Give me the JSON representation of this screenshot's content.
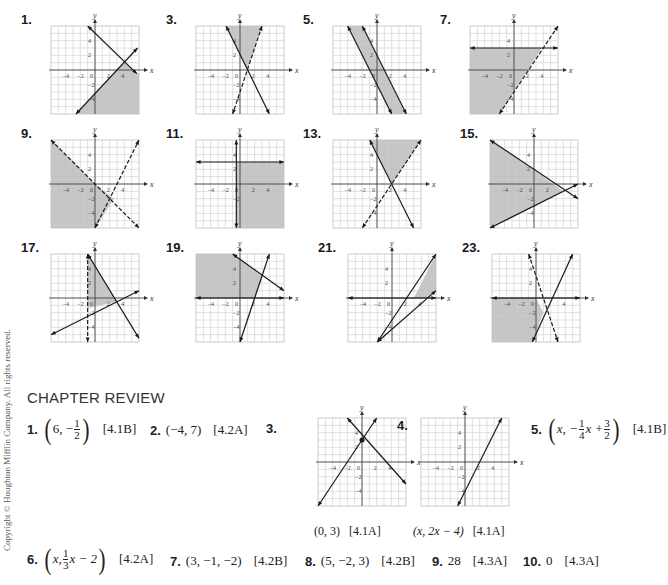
{
  "graphs": [
    {
      "id": "1",
      "label": "1.",
      "x": 33,
      "y": 18,
      "range": [
        -6,
        6
      ],
      "shade": [
        [
          -2.5,
          -6
        ],
        [
          4,
          1
        ],
        [
          6,
          -0.5
        ],
        [
          6,
          -6
        ]
      ],
      "lines": [
        {
          "p1": [
            -1,
            6
          ],
          "p2": [
            5.7,
            -0.5
          ],
          "dashed": false
        },
        {
          "p1": [
            -2.6,
            -6
          ],
          "p2": [
            5.8,
            3
          ],
          "dashed": false
        }
      ],
      "ticks_x": [
        "-4",
        "-2",
        "0",
        "2",
        "4"
      ],
      "ticks_y": [
        "4",
        "2",
        "-2",
        "-4"
      ]
    },
    {
      "id": "3",
      "label": "3.",
      "x": 178,
      "y": 18,
      "range": [
        -6,
        6
      ],
      "shade": [
        [
          -1.9,
          6
        ],
        [
          3,
          6
        ],
        [
          1,
          0
        ]
      ],
      "lines": [
        {
          "p1": [
            -1.9,
            6
          ],
          "p2": [
            4,
            -6
          ],
          "dashed": false
        },
        {
          "p1": [
            3,
            6
          ],
          "p2": [
            -1,
            -6
          ],
          "dashed": true
        }
      ],
      "ticks_x": [
        "-4",
        "-2",
        "0",
        "2",
        "4"
      ],
      "ticks_y": [
        "4",
        "2",
        "-2",
        "-4"
      ]
    },
    {
      "id": "5",
      "label": "5.",
      "x": 315,
      "y": 18,
      "range": [
        -6,
        6
      ],
      "shade": [
        [
          -4,
          6
        ],
        [
          -2,
          6
        ],
        [
          3.9,
          -6
        ],
        [
          1.9,
          -6
        ]
      ],
      "lines": [
        {
          "p1": [
            -4,
            6
          ],
          "p2": [
            2,
            -6
          ],
          "dashed": false
        },
        {
          "p1": [
            -2,
            6
          ],
          "p2": [
            4,
            -6
          ],
          "dashed": false
        }
      ],
      "ticks_x": [
        "-4",
        "-2",
        "0",
        "2",
        "4"
      ],
      "ticks_y": [
        "4",
        "2",
        "-2",
        "-4"
      ]
    },
    {
      "id": "7",
      "label": "7.",
      "x": 452,
      "y": 18,
      "range": [
        -6,
        6
      ],
      "shade": [
        [
          -6,
          3
        ],
        [
          3.8,
          3
        ],
        [
          -2,
          -6
        ],
        [
          -6,
          -6
        ]
      ],
      "lines": [
        {
          "p1": [
            -6,
            3
          ],
          "p2": [
            6,
            3
          ],
          "dashed": false
        },
        {
          "p1": [
            -2,
            -6
          ],
          "p2": [
            6,
            6
          ],
          "dashed": true
        }
      ],
      "ticks_x": [
        "-4",
        "-2",
        "0",
        "2",
        "4"
      ],
      "ticks_y": [
        "4",
        "2",
        "-2",
        "-4"
      ]
    },
    {
      "id": "9",
      "label": "9.",
      "x": 33,
      "y": 132,
      "range": [
        -6,
        6
      ],
      "shade": [
        [
          -6,
          6
        ],
        [
          0,
          0
        ],
        [
          2.6,
          -2
        ],
        [
          0,
          -6
        ],
        [
          -6,
          -6
        ]
      ],
      "lines": [
        {
          "p1": [
            -6,
            6
          ],
          "p2": [
            6,
            -6
          ],
          "dashed": true
        },
        {
          "p1": [
            0,
            -6
          ],
          "p2": [
            6,
            6
          ],
          "dashed": true
        }
      ],
      "ticks_x": [
        "-4",
        "-2",
        "0",
        "2",
        "4"
      ],
      "ticks_y": [
        "4",
        "2",
        "-2",
        "-4"
      ]
    },
    {
      "id": "11",
      "label": "11.",
      "x": 178,
      "y": 132,
      "range": [
        -6,
        6
      ],
      "shade": [
        [
          -0.5,
          3
        ],
        [
          6,
          3
        ],
        [
          6,
          -6
        ],
        [
          -0.5,
          -6
        ]
      ],
      "lines": [
        {
          "p1": [
            -6,
            3
          ],
          "p2": [
            6,
            3
          ],
          "dashed": false
        },
        {
          "p1": [
            -0.5,
            6
          ],
          "p2": [
            -0.5,
            -6
          ],
          "dashed": false
        }
      ],
      "ticks_x": [
        "-4",
        "-2",
        "0",
        "2",
        "4"
      ],
      "ticks_y": [
        "4",
        "2",
        "-2"
      ]
    },
    {
      "id": "13",
      "label": "13.",
      "x": 315,
      "y": 132,
      "range": [
        -6,
        6
      ],
      "shade": [
        [
          -1,
          6
        ],
        [
          6,
          6
        ],
        [
          2,
          0
        ]
      ],
      "lines": [
        {
          "p1": [
            -1,
            6
          ],
          "p2": [
            5,
            -6
          ],
          "dashed": false
        },
        {
          "p1": [
            6,
            6
          ],
          "p2": [
            -2,
            -6
          ],
          "dashed": true
        }
      ],
      "ticks_x": [
        "-4",
        "-2",
        "0",
        "2",
        "4"
      ],
      "ticks_y": [
        "4",
        "2",
        "-2",
        "-4"
      ]
    },
    {
      "id": "15",
      "label": "15.",
      "x": 472,
      "y": 132,
      "range": [
        -6,
        6
      ],
      "shade": [
        [
          -6,
          6
        ],
        [
          4,
          -1
        ],
        [
          -6,
          -6
        ]
      ],
      "lines": [
        {
          "p1": [
            -6,
            6
          ],
          "p2": [
            6,
            -2
          ],
          "dashed": false
        },
        {
          "p1": [
            -6,
            -6
          ],
          "p2": [
            6,
            0
          ],
          "dashed": false
        }
      ],
      "ticks_x": [
        "-4",
        "-2",
        "0",
        "2"
      ],
      "ticks_y": [
        "4",
        "2",
        "-2",
        "-4"
      ]
    },
    {
      "id": "17",
      "label": "17.",
      "x": 33,
      "y": 246,
      "range": [
        -6,
        6
      ],
      "shade": [
        [
          -1,
          6
        ],
        [
          -1,
          -1.4
        ],
        [
          3,
          -0.5
        ]
      ],
      "lines": [
        {
          "p1": [
            -1,
            6
          ],
          "p2": [
            6,
            -5.5
          ],
          "dashed": false
        },
        {
          "p1": [
            -6,
            -5
          ],
          "p2": [
            6,
            1
          ],
          "dashed": false
        },
        {
          "p1": [
            -1,
            6
          ],
          "p2": [
            -1,
            -6
          ],
          "dashed": true
        }
      ],
      "ticks_x": [
        "-4",
        "-2",
        "0",
        "2",
        "4"
      ],
      "ticks_y": [
        "4",
        "2",
        "-2",
        "-4"
      ]
    },
    {
      "id": "19",
      "label": "19.",
      "x": 178,
      "y": 246,
      "range": [
        -6,
        6
      ],
      "shade": [
        [
          -6,
          6
        ],
        [
          -1,
          6
        ],
        [
          3,
          3
        ],
        [
          2,
          0
        ],
        [
          -6,
          0
        ]
      ],
      "lines": [
        {
          "p1": [
            -1,
            6
          ],
          "p2": [
            6,
            1
          ],
          "dashed": false
        },
        {
          "p1": [
            0,
            -6
          ],
          "p2": [
            4,
            6
          ],
          "dashed": false
        },
        {
          "p1": [
            -6,
            0
          ],
          "p2": [
            6,
            0
          ],
          "dashed": false
        }
      ],
      "ticks_x": [
        "-4",
        "-2",
        "0",
        "2",
        "4"
      ],
      "ticks_y": [
        "4",
        "2",
        "-2",
        "-4"
      ]
    },
    {
      "id": "21",
      "label": "21.",
      "x": 330,
      "y": 246,
      "range": [
        -6,
        6
      ],
      "shade": [
        [
          3,
          0
        ],
        [
          6,
          6
        ],
        [
          6,
          1
        ],
        [
          5,
          0
        ]
      ],
      "lines": [
        {
          "p1": [
            -2,
            -6
          ],
          "p2": [
            6,
            6
          ],
          "dashed": false
        },
        {
          "p1": [
            -2,
            -6
          ],
          "p2": [
            6,
            1
          ],
          "dashed": false
        },
        {
          "p1": [
            -6,
            0
          ],
          "p2": [
            6,
            0
          ],
          "dashed": false
        }
      ],
      "ticks_x": [
        "-4",
        "-2",
        "0",
        "2",
        "4"
      ],
      "ticks_y": [
        "4",
        "2",
        "-2",
        "-4"
      ]
    },
    {
      "id": "23",
      "label": "23.",
      "x": 474,
      "y": 246,
      "range": [
        -6,
        6
      ],
      "shade": [
        [
          -6,
          0
        ],
        [
          0,
          0
        ],
        [
          1,
          -2
        ],
        [
          -0.5,
          -6
        ],
        [
          -6,
          -6
        ]
      ],
      "lines": [
        {
          "p1": [
            -1,
            6
          ],
          "p2": [
            3,
            -6
          ],
          "dashed": true
        },
        {
          "p1": [
            -0.5,
            -6
          ],
          "p2": [
            5,
            6
          ],
          "dashed": false
        },
        {
          "p1": [
            -6,
            0
          ],
          "p2": [
            6,
            0
          ],
          "dashed": false
        }
      ],
      "ticks_x": [
        "-4",
        "-2",
        "0",
        "4"
      ],
      "ticks_y": [
        "4",
        "2",
        "-2",
        "-4"
      ]
    }
  ],
  "chapter_review": {
    "title": "CHAPTER REVIEW",
    "answers": [
      {
        "n": "1.",
        "text": "6, −",
        "frac": [
          "1",
          "2"
        ],
        "ref": "[4.1B]"
      },
      {
        "n": "2.",
        "text": "(−4, 7)",
        "ref": "[4.2A]"
      },
      {
        "n": "3.",
        "caption": "(0, 3)",
        "ref": "[4.1A]"
      },
      {
        "n": "4.",
        "caption": "(x, 2x − 4)",
        "ref": "[4.1A]"
      },
      {
        "n": "5.",
        "text_a": "x, −",
        "frac1": [
          "1",
          "4"
        ],
        "text_b": "x +",
        "frac2": [
          "3",
          "2"
        ],
        "ref": "[4.1B]"
      },
      {
        "n": "6.",
        "text_a": "x, ",
        "frac": [
          "1",
          "3"
        ],
        "text_b": "x − 2",
        "ref": "[4.2A]"
      },
      {
        "n": "7.",
        "text": "(3, −1, −2)",
        "ref": "[4.2B]"
      },
      {
        "n": "8.",
        "text": "(5, −2, 3)",
        "ref": "[4.2B]"
      },
      {
        "n": "9.",
        "text": "28",
        "ref": "[4.3A]"
      },
      {
        "n": "10.",
        "text": "0",
        "ref": "[4.3A]"
      }
    ],
    "graphs": [
      {
        "id": "cr3",
        "x": 310,
        "y": 410,
        "range": [
          -6,
          6
        ],
        "shade": [],
        "lines": [
          {
            "p1": [
              -6,
              -6
            ],
            "p2": [
              2,
              6
            ],
            "dashed": false
          },
          {
            "p1": [
              -2,
              6
            ],
            "p2": [
              6,
              -3
            ],
            "dashed": false
          }
        ],
        "point": [
          0,
          3
        ],
        "ticks_x": [
          "-4",
          "-2",
          "0",
          "2",
          "4"
        ],
        "ticks_y": [
          "4",
          "2",
          "-2",
          "-4"
        ]
      },
      {
        "id": "cr4",
        "x": 413,
        "y": 410,
        "range": [
          -6,
          6
        ],
        "shade": [],
        "lines": [
          {
            "p1": [
              -1,
              -6
            ],
            "p2": [
              5,
              6
            ],
            "dashed": false
          }
        ],
        "ticks_x": [
          "-4",
          "-2",
          "0",
          "2",
          "4"
        ],
        "ticks_y": [
          "4",
          "2",
          "-2",
          "-4"
        ]
      }
    ]
  },
  "copyright": "Copyright © Houghton Mifflin Company. All rights reserved.",
  "colors": {
    "shade": "#bdbdbd",
    "grid": "#d4d4d4",
    "line": "#1a1a1a",
    "axis": "#333333"
  }
}
